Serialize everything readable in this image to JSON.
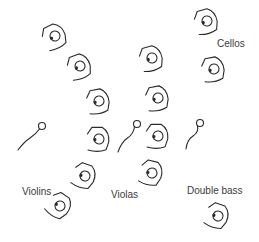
{
  "labels": {
    "cellos": "Cellos",
    "violins": "Violins",
    "violas": "Violas",
    "double_bass": "Double bass"
  },
  "sections": [
    {
      "name": "Violins",
      "seats": [
        {
          "x": 55,
          "y": 36,
          "rot": -20
        },
        {
          "x": 80,
          "y": 66,
          "rot": -15
        },
        {
          "x": 99,
          "y": 101,
          "rot": -5
        },
        {
          "x": 99,
          "y": 139,
          "rot": 5
        },
        {
          "x": 85,
          "y": 176,
          "rot": 25
        },
        {
          "x": 60,
          "y": 206,
          "rot": 40
        }
      ]
    },
    {
      "name": "Violas",
      "seats": [
        {
          "x": 152,
          "y": 58,
          "rot": -10
        },
        {
          "x": 158,
          "y": 98,
          "rot": -5
        },
        {
          "x": 158,
          "y": 136,
          "rot": 5
        },
        {
          "x": 152,
          "y": 173,
          "rot": 20
        }
      ]
    },
    {
      "name": "Cellos",
      "seats": [
        {
          "x": 207,
          "y": 21,
          "rot": -10
        },
        {
          "x": 214,
          "y": 69,
          "rot": -5
        }
      ]
    },
    {
      "name": "Double bass",
      "seats": [
        {
          "x": 218,
          "y": 216,
          "rot": 25
        }
      ]
    }
  ],
  "instruments": [
    {
      "head": [
        42,
        126
      ],
      "tail": [
        18,
        150
      ]
    },
    {
      "head": [
        137,
        124
      ],
      "tail": [
        118,
        152
      ]
    },
    {
      "head": [
        200,
        123
      ],
      "tail": [
        186,
        149
      ]
    }
  ],
  "colors": {
    "stroke": "#2a2a2a",
    "text": "#3a3a3a",
    "background": "#ffffff"
  }
}
